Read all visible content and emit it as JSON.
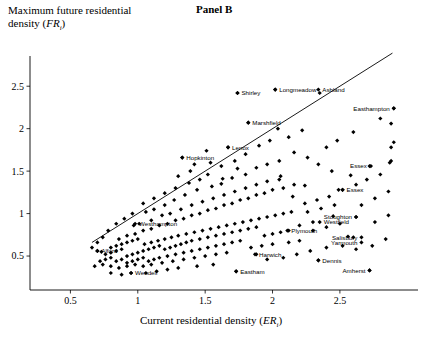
{
  "panel": {
    "title": "Panel B"
  },
  "axes": {
    "y_label_line1": "Maximum future residential",
    "y_label_line2_prefix": "density (",
    "y_label_var": "FR",
    "y_label_sub": "i",
    "y_label_suffix": ")",
    "x_label_prefix": "Current residential density (",
    "x_label_var": "ER",
    "x_label_sub": "i",
    "x_label_suffix": ")",
    "x_ticks": [
      "0.5",
      "1",
      "1.5",
      "2",
      "2.5"
    ],
    "y_ticks": [
      "0.5",
      "1",
      "1.5",
      "2",
      "2.5"
    ],
    "xlim": [
      0.2,
      3.05
    ],
    "ylim": [
      0.1,
      2.95
    ]
  },
  "chart_data": {
    "type": "scatter",
    "title": "Panel B",
    "xlabel": "Current residential density (ER_i)",
    "ylabel": "Maximum future residential density (FR_i)",
    "xlim": [
      0.2,
      3.05
    ],
    "ylim": [
      0.1,
      2.95
    ],
    "grid": false,
    "legend": "none",
    "reference_line": {
      "description": "45-degree line FR_i = ER_i",
      "x0": 0.66,
      "y0": 0.66,
      "x1": 2.89,
      "y1": 2.89
    },
    "annotations": [
      {
        "label": "Shirley",
        "x": 1.74,
        "y": 2.42
      },
      {
        "label": "Longmeadow",
        "x": 2.02,
        "y": 2.46
      },
      {
        "label": "Ashland",
        "x": 2.34,
        "y": 2.46
      },
      {
        "label": "Easthampton",
        "x": 2.9,
        "y": 2.24
      },
      {
        "label": "Marshfield",
        "x": 1.82,
        "y": 2.07
      },
      {
        "label": "Lenox",
        "x": 1.67,
        "y": 1.78
      },
      {
        "label": "Hopkinton",
        "x": 1.33,
        "y": 1.66
      },
      {
        "label": "Essex",
        "x": 2.73,
        "y": 1.56
      },
      {
        "label": "Essex",
        "x": 2.52,
        "y": 1.28
      },
      {
        "label": "Stoughton",
        "x": 2.62,
        "y": 0.96
      },
      {
        "label": "Westfield",
        "x": 2.35,
        "y": 0.9
      },
      {
        "label": "Westhampton",
        "x": 0.98,
        "y": 0.88
      },
      {
        "label": "Plymouth",
        "x": 2.11,
        "y": 0.8
      },
      {
        "label": "Salisbury",
        "x": 2.66,
        "y": 0.72
      },
      {
        "label": "Yarmouth",
        "x": 2.66,
        "y": 0.66
      },
      {
        "label": "Alford",
        "x": 0.7,
        "y": 0.56
      },
      {
        "label": "Harwich",
        "x": 1.87,
        "y": 0.52
      },
      {
        "label": "Dennis",
        "x": 2.34,
        "y": 0.45
      },
      {
        "label": "Amherst",
        "x": 2.72,
        "y": 0.33
      },
      {
        "label": "Wendell",
        "x": 0.95,
        "y": 0.3
      },
      {
        "label": "Eastham",
        "x": 1.73,
        "y": 0.32
      }
    ],
    "points": [
      [
        1.74,
        2.42
      ],
      [
        2.02,
        2.46
      ],
      [
        2.35,
        2.42
      ],
      [
        2.9,
        2.24
      ],
      [
        1.82,
        2.07
      ],
      [
        2.8,
        2.12
      ],
      [
        2.88,
        2.06
      ],
      [
        1.67,
        1.78
      ],
      [
        1.51,
        1.74
      ],
      [
        1.33,
        1.66
      ],
      [
        2.9,
        1.84
      ],
      [
        2.88,
        1.78
      ],
      [
        2.72,
        1.56
      ],
      [
        2.88,
        1.62
      ],
      [
        2.87,
        1.6
      ],
      [
        2.52,
        1.28
      ],
      [
        2.49,
        1.28
      ],
      [
        2.58,
        1.45
      ],
      [
        2.24,
        1.33
      ],
      [
        2.05,
        1.4
      ],
      [
        1.74,
        1.53
      ],
      [
        1.42,
        1.58
      ],
      [
        1.39,
        1.5
      ],
      [
        1.52,
        1.46
      ],
      [
        1.63,
        1.41
      ],
      [
        1.3,
        1.44
      ],
      [
        2.62,
        0.96
      ],
      [
        2.45,
        0.97
      ],
      [
        2.3,
        0.9
      ],
      [
        2.12,
        0.8
      ],
      [
        2.56,
        0.73
      ],
      [
        2.6,
        0.72
      ],
      [
        2.34,
        0.45
      ],
      [
        2.72,
        0.33
      ],
      [
        1.88,
        0.52
      ],
      [
        1.73,
        0.32
      ],
      [
        0.95,
        0.3
      ],
      [
        0.7,
        0.56
      ],
      [
        0.73,
        0.55
      ],
      [
        1.01,
        0.88
      ],
      [
        0.97,
        0.86
      ],
      [
        1.06,
        1.02
      ],
      [
        1.12,
        1.05
      ],
      [
        1.2,
        1.1
      ],
      [
        1.27,
        1.16
      ],
      [
        1.35,
        1.22
      ],
      [
        1.44,
        1.28
      ],
      [
        1.55,
        1.32
      ],
      [
        1.62,
        1.35
      ],
      [
        1.7,
        1.42
      ],
      [
        1.8,
        1.46
      ],
      [
        1.88,
        1.54
      ],
      [
        1.96,
        1.58
      ],
      [
        2.05,
        1.62
      ],
      [
        1.1,
        0.92
      ],
      [
        1.18,
        0.98
      ],
      [
        1.24,
        1.0
      ],
      [
        1.32,
        1.05
      ],
      [
        1.4,
        1.1
      ],
      [
        1.48,
        1.14
      ],
      [
        1.56,
        1.18
      ],
      [
        1.64,
        1.22
      ],
      [
        1.72,
        1.26
      ],
      [
        1.8,
        1.3
      ],
      [
        1.88,
        1.34
      ],
      [
        1.96,
        1.38
      ],
      [
        2.06,
        1.44
      ],
      [
        2.15,
        1.2
      ],
      [
        2.24,
        1.12
      ],
      [
        2.33,
        1.16
      ],
      [
        2.42,
        1.2
      ],
      [
        0.86,
        0.7
      ],
      [
        0.92,
        0.74
      ],
      [
        0.98,
        0.76
      ],
      [
        1.04,
        0.8
      ],
      [
        1.1,
        0.82
      ],
      [
        1.16,
        0.86
      ],
      [
        1.22,
        0.88
      ],
      [
        1.28,
        0.92
      ],
      [
        1.34,
        0.94
      ],
      [
        1.4,
        0.98
      ],
      [
        1.46,
        1.0
      ],
      [
        1.52,
        1.04
      ],
      [
        1.58,
        1.06
      ],
      [
        1.64,
        1.1
      ],
      [
        1.7,
        1.12
      ],
      [
        1.76,
        1.16
      ],
      [
        1.82,
        1.18
      ],
      [
        1.88,
        1.22
      ],
      [
        1.94,
        1.24
      ],
      [
        2.0,
        1.28
      ],
      [
        2.08,
        1.3
      ],
      [
        2.16,
        1.34
      ],
      [
        2.26,
        1.02
      ],
      [
        2.36,
        1.06
      ],
      [
        2.46,
        1.1
      ],
      [
        0.8,
        0.6
      ],
      [
        0.84,
        0.62
      ],
      [
        0.88,
        0.64
      ],
      [
        0.92,
        0.66
      ],
      [
        0.96,
        0.68
      ],
      [
        1.0,
        0.7
      ],
      [
        1.05,
        0.64
      ],
      [
        1.1,
        0.66
      ],
      [
        1.15,
        0.68
      ],
      [
        1.2,
        0.7
      ],
      [
        1.25,
        0.72
      ],
      [
        1.3,
        0.74
      ],
      [
        1.36,
        0.76
      ],
      [
        1.42,
        0.78
      ],
      [
        1.48,
        0.8
      ],
      [
        1.54,
        0.82
      ],
      [
        1.6,
        0.84
      ],
      [
        1.66,
        0.86
      ],
      [
        1.72,
        0.88
      ],
      [
        1.78,
        0.9
      ],
      [
        1.84,
        0.92
      ],
      [
        1.9,
        0.94
      ],
      [
        1.96,
        0.96
      ],
      [
        2.02,
        0.98
      ],
      [
        2.08,
        1.0
      ],
      [
        2.14,
        1.02
      ],
      [
        2.2,
        0.86
      ],
      [
        2.3,
        0.8
      ],
      [
        2.4,
        0.84
      ],
      [
        2.5,
        0.88
      ],
      [
        0.76,
        0.52
      ],
      [
        0.8,
        0.54
      ],
      [
        0.84,
        0.56
      ],
      [
        0.88,
        0.58
      ],
      [
        0.92,
        0.5
      ],
      [
        0.96,
        0.52
      ],
      [
        1.0,
        0.54
      ],
      [
        1.04,
        0.56
      ],
      [
        1.08,
        0.58
      ],
      [
        1.12,
        0.6
      ],
      [
        1.16,
        0.62
      ],
      [
        1.2,
        0.58
      ],
      [
        1.24,
        0.6
      ],
      [
        1.28,
        0.62
      ],
      [
        1.32,
        0.64
      ],
      [
        1.36,
        0.66
      ],
      [
        1.4,
        0.68
      ],
      [
        1.46,
        0.7
      ],
      [
        1.52,
        0.72
      ],
      [
        1.58,
        0.74
      ],
      [
        1.64,
        0.76
      ],
      [
        1.7,
        0.78
      ],
      [
        1.76,
        0.8
      ],
      [
        1.82,
        0.82
      ],
      [
        1.88,
        0.84
      ],
      [
        1.94,
        0.74
      ],
      [
        2.0,
        0.76
      ],
      [
        2.06,
        0.78
      ],
      [
        2.12,
        0.66
      ],
      [
        2.2,
        0.68
      ],
      [
        0.72,
        0.44
      ],
      [
        0.76,
        0.46
      ],
      [
        0.8,
        0.48
      ],
      [
        0.84,
        0.44
      ],
      [
        0.88,
        0.46
      ],
      [
        0.92,
        0.42
      ],
      [
        0.96,
        0.44
      ],
      [
        1.0,
        0.46
      ],
      [
        1.04,
        0.48
      ],
      [
        1.08,
        0.44
      ],
      [
        1.12,
        0.46
      ],
      [
        1.16,
        0.48
      ],
      [
        1.22,
        0.5
      ],
      [
        1.28,
        0.52
      ],
      [
        1.34,
        0.54
      ],
      [
        1.4,
        0.56
      ],
      [
        1.46,
        0.58
      ],
      [
        1.52,
        0.6
      ],
      [
        1.58,
        0.62
      ],
      [
        1.64,
        0.64
      ],
      [
        1.7,
        0.66
      ],
      [
        1.76,
        0.68
      ],
      [
        1.84,
        0.6
      ],
      [
        1.92,
        0.62
      ],
      [
        2.0,
        0.64
      ],
      [
        0.68,
        0.38
      ],
      [
        0.74,
        0.4
      ],
      [
        0.8,
        0.38
      ],
      [
        0.86,
        0.36
      ],
      [
        0.92,
        0.38
      ],
      [
        0.98,
        0.4
      ],
      [
        1.04,
        0.38
      ],
      [
        1.1,
        0.4
      ],
      [
        1.18,
        0.42
      ],
      [
        1.26,
        0.44
      ],
      [
        1.34,
        0.46
      ],
      [
        1.42,
        0.48
      ],
      [
        1.5,
        0.5
      ],
      [
        1.58,
        0.52
      ],
      [
        1.66,
        0.54
      ],
      [
        1.06,
        0.3
      ],
      [
        1.14,
        0.32
      ],
      [
        1.22,
        0.34
      ],
      [
        0.88,
        0.28
      ],
      [
        0.8,
        0.3
      ],
      [
        1.3,
        0.36
      ],
      [
        1.44,
        0.38
      ],
      [
        1.56,
        0.4
      ],
      [
        1.96,
        0.46
      ],
      [
        2.08,
        0.48
      ],
      [
        2.18,
        0.52
      ],
      [
        2.28,
        0.56
      ],
      [
        2.4,
        0.6
      ],
      [
        2.52,
        0.62
      ],
      [
        2.62,
        0.58
      ],
      [
        2.74,
        0.62
      ],
      [
        2.84,
        0.7
      ],
      [
        2.76,
        0.9
      ],
      [
        2.86,
        0.98
      ],
      [
        2.66,
        1.1
      ],
      [
        2.76,
        1.18
      ],
      [
        2.86,
        1.26
      ],
      [
        2.62,
        1.34
      ],
      [
        2.7,
        1.4
      ],
      [
        2.8,
        1.46
      ],
      [
        2.44,
        1.5
      ],
      [
        2.34,
        1.58
      ],
      [
        2.26,
        1.66
      ],
      [
        2.16,
        1.72
      ],
      [
        2.6,
        1.96
      ],
      [
        2.48,
        1.86
      ],
      [
        2.4,
        1.78
      ],
      [
        2.12,
        1.9
      ],
      [
        2.22,
        1.98
      ],
      [
        1.98,
        1.86
      ],
      [
        1.9,
        1.8
      ],
      [
        2.04,
        2.0
      ],
      [
        1.8,
        1.7
      ],
      [
        1.72,
        1.62
      ],
      [
        1.62,
        1.56
      ],
      [
        1.54,
        1.6
      ],
      [
        1.46,
        1.4
      ],
      [
        1.38,
        1.36
      ],
      [
        1.28,
        1.3
      ],
      [
        1.2,
        1.24
      ],
      [
        1.12,
        1.18
      ],
      [
        1.04,
        1.12
      ],
      [
        0.96,
        1.0
      ],
      [
        0.9,
        0.94
      ],
      [
        0.84,
        0.88
      ],
      [
        0.78,
        0.8
      ],
      [
        0.74,
        0.72
      ],
      [
        0.7,
        0.66
      ],
      [
        0.66,
        0.6
      ]
    ]
  }
}
